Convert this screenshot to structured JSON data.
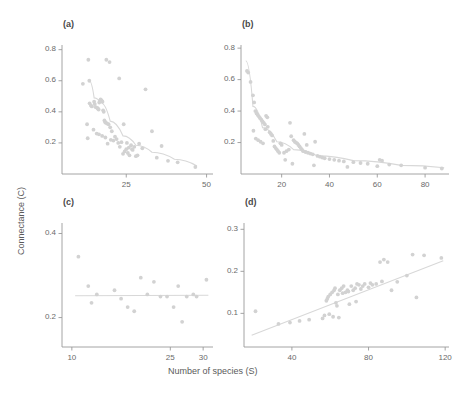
{
  "figure": {
    "xlabel": "Number of species (S)",
    "ylabel": "Connectance (C)",
    "point_color": "#d2d2d2",
    "trend_color": "#d8d8d8",
    "axis_color": "#9a9a9a"
  },
  "panels": {
    "a": {
      "label": "(a)"
    },
    "b": {
      "label": "(b)"
    },
    "c": {
      "label": "(c)"
    },
    "d": {
      "label": "(d)"
    }
  },
  "chart_data": [
    {
      "type": "scatter",
      "panel": "(a)",
      "title": "",
      "xlabel": "Number of species (S)",
      "ylabel": "Connectance (C)",
      "xlim": [
        5,
        52
      ],
      "ylim": [
        0.0,
        0.83
      ],
      "xticks": [
        25,
        50
      ],
      "yticks": [
        0.2,
        0.4,
        0.6,
        0.8
      ],
      "xticklabels": [
        "25",
        "50"
      ],
      "yticklabels": [
        "0.2",
        "0.4",
        "0.6",
        "0.8"
      ],
      "grid": false,
      "legend": null,
      "x": [
        11.5,
        13.5,
        13.6,
        14.0,
        14.3,
        15.0,
        15.2,
        15.5,
        16.0,
        16.2,
        16.4,
        16.6,
        16.8,
        17.0,
        17.2,
        17.4,
        17.6,
        17.8,
        18.0,
        18.2,
        18.4,
        18.6,
        19.0,
        19.5,
        20.0,
        20.5,
        12.8,
        13.0,
        14.8,
        15.8,
        16.5,
        17.5,
        18.5,
        19.2,
        20.2,
        21.0,
        21.5,
        22.0,
        22.5,
        23.0,
        23.5,
        24.0,
        24.5,
        25.0,
        25.2,
        25.5,
        26.0,
        26.5,
        27.0,
        27.5,
        28.0,
        28.5,
        29.0,
        30.0,
        31.0,
        33.0,
        34.5,
        36.0,
        38.0,
        41.0,
        46.5,
        13.2,
        18.8,
        19.8,
        22.8,
        24.2,
        25.8,
        26.8
      ],
      "y": [
        0.58,
        0.6,
        0.455,
        0.44,
        0.435,
        0.465,
        0.45,
        0.43,
        0.425,
        0.42,
        0.415,
        0.46,
        0.47,
        0.48,
        0.475,
        0.47,
        0.465,
        0.41,
        0.4,
        0.345,
        0.335,
        0.33,
        0.325,
        0.32,
        0.3,
        0.275,
        0.32,
        0.23,
        0.285,
        0.26,
        0.255,
        0.245,
        0.235,
        0.195,
        0.22,
        0.215,
        0.24,
        0.225,
        0.2,
        0.175,
        0.205,
        0.13,
        0.145,
        0.16,
        0.2,
        0.135,
        0.12,
        0.185,
        0.155,
        0.175,
        0.115,
        0.12,
        0.195,
        0.165,
        0.545,
        0.275,
        0.105,
        0.18,
        0.085,
        0.075,
        0.045,
        0.735,
        0.735,
        0.72,
        0.615,
        0.32,
        0.17,
        0.16
      ],
      "trend": {
        "type": "power-fit",
        "x": [
          13.5,
          15,
          17,
          20,
          24,
          28,
          33,
          40,
          47
        ],
        "y": [
          0.6,
          0.49,
          0.46,
          0.34,
          0.245,
          0.185,
          0.14,
          0.095,
          0.052
        ]
      }
    },
    {
      "type": "scatter",
      "panel": "(b)",
      "title": "",
      "xlabel": "Number of species (S)",
      "ylabel": "Connectance (C)",
      "xlim": [
        3,
        90
      ],
      "ylim": [
        0.0,
        0.82
      ],
      "xticks": [
        20,
        40,
        60,
        80
      ],
      "yticks": [
        0.2,
        0.4,
        0.6,
        0.8
      ],
      "xticklabels": [
        "20",
        "40",
        "60",
        "80"
      ],
      "yticklabels": [
        "0.2",
        "0.4",
        "0.6",
        "0.8"
      ],
      "grid": false,
      "legend": null,
      "x": [
        5.5,
        6.0,
        7.0,
        8.0,
        8.5,
        9.0,
        9.5,
        10.0,
        10.5,
        11.0,
        11.5,
        12.0,
        12.5,
        13.0,
        13.5,
        14.0,
        8.2,
        9.2,
        10.2,
        11.2,
        12.2,
        13.2,
        14.2,
        15.0,
        15.5,
        16.0,
        16.5,
        17.0,
        17.5,
        18.0,
        18.5,
        19.0,
        19.5,
        20.0,
        21.0,
        22.0,
        23.0,
        24.0,
        25.0,
        25.5,
        26.0,
        26.5,
        27.0,
        27.5,
        28.0,
        28.5,
        29.0,
        30.0,
        31.0,
        32.0,
        33.0,
        34.0,
        35.0,
        36.0,
        37.0,
        38.0,
        40.0,
        42.0,
        44.0,
        46.0,
        47.5,
        50.0,
        53.0,
        56.0,
        60.0,
        61.0,
        62.0,
        65.0,
        70.0,
        80.0,
        87.0,
        23.5,
        29.5,
        30.5,
        24.5,
        33.5,
        21.5
      ],
      "y": [
        0.655,
        0.645,
        0.585,
        0.5,
        0.455,
        0.4,
        0.385,
        0.375,
        0.365,
        0.355,
        0.345,
        0.335,
        0.325,
        0.315,
        0.37,
        0.36,
        0.275,
        0.225,
        0.215,
        0.205,
        0.195,
        0.285,
        0.3,
        0.265,
        0.255,
        0.245,
        0.21,
        0.175,
        0.165,
        0.155,
        0.145,
        0.135,
        0.195,
        0.185,
        0.135,
        0.145,
        0.155,
        0.24,
        0.215,
        0.205,
        0.2,
        0.195,
        0.185,
        0.175,
        0.165,
        0.155,
        0.145,
        0.14,
        0.135,
        0.13,
        0.125,
        0.205,
        0.115,
        0.11,
        0.105,
        0.1,
        0.095,
        0.09,
        0.085,
        0.08,
        0.045,
        0.075,
        0.07,
        0.065,
        0.05,
        0.09,
        0.085,
        0.06,
        0.055,
        0.04,
        0.035,
        0.325,
        0.255,
        0.185,
        0.065,
        0.055,
        0.09
      ],
      "trend": {
        "type": "power-fit",
        "x": [
          5,
          8,
          12,
          18,
          25,
          35,
          50,
          70,
          88
        ],
        "y": [
          0.72,
          0.43,
          0.295,
          0.205,
          0.155,
          0.115,
          0.085,
          0.055,
          0.04
        ]
      }
    },
    {
      "type": "scatter",
      "panel": "(c)",
      "title": "",
      "xlabel": "Number of species (S)",
      "ylabel": "Connectance (C)",
      "xlim": [
        8.5,
        31.5
      ],
      "ylim": [
        0.13,
        0.425
      ],
      "xticks": [
        10,
        25,
        30
      ],
      "yticks": [
        0.2,
        0.4
      ],
      "xticklabels": [
        "10",
        "25",
        "30"
      ],
      "yticklabels": [
        "0.2",
        "0.4"
      ],
      "grid": false,
      "legend": null,
      "x": [
        11.0,
        12.5,
        13.0,
        13.8,
        16.5,
        17.5,
        18.5,
        19.5,
        20.5,
        21.5,
        22.5,
        23.5,
        24.5,
        25.5,
        26.2,
        26.8,
        27.5,
        28.5,
        29.0,
        30.5
      ],
      "y": [
        0.345,
        0.275,
        0.235,
        0.255,
        0.265,
        0.245,
        0.225,
        0.215,
        0.295,
        0.255,
        0.285,
        0.25,
        0.25,
        0.225,
        0.275,
        0.19,
        0.25,
        0.255,
        0.25,
        0.29
      ],
      "trend": {
        "type": "linear-fit",
        "x": [
          10.5,
          30.8
        ],
        "y": [
          0.252,
          0.253
        ]
      }
    },
    {
      "type": "scatter",
      "panel": "(d)",
      "title": "",
      "xlabel": "Number of species (S)",
      "ylabel": "Connectance (C)",
      "xlim": [
        15,
        122
      ],
      "ylim": [
        0.02,
        0.315
      ],
      "xticks": [
        40,
        80,
        120
      ],
      "yticks": [
        0.1,
        0.2,
        0.3
      ],
      "xticklabels": [
        "40",
        "80",
        "120"
      ],
      "yticklabels": [
        "0.1",
        "0.2",
        "0.3"
      ],
      "grid": false,
      "legend": null,
      "x": [
        21.0,
        33.0,
        39.0,
        44.0,
        49.0,
        56.0,
        57.0,
        58.0,
        58.5,
        59.0,
        60.0,
        61.0,
        62.0,
        62.5,
        63.0,
        63.5,
        64.0,
        65.0,
        66.0,
        67.0,
        68.0,
        69.0,
        70.0,
        71.0,
        72.0,
        73.0,
        74.0,
        75.0,
        76.0,
        77.0,
        78.0,
        80.0,
        81.0,
        82.0,
        84.0,
        86.0,
        88.0,
        90.0,
        92.0,
        95.0,
        100.0,
        103.0,
        105.0,
        109.0,
        118.0,
        59.5,
        61.5,
        64.5,
        66.5,
        69.5,
        73.5,
        87.0
      ],
      "y": [
        0.105,
        0.075,
        0.078,
        0.082,
        0.085,
        0.088,
        0.095,
        0.13,
        0.135,
        0.14,
        0.145,
        0.15,
        0.155,
        0.16,
        0.125,
        0.118,
        0.145,
        0.155,
        0.16,
        0.165,
        0.15,
        0.155,
        0.122,
        0.165,
        0.155,
        0.16,
        0.17,
        0.168,
        0.158,
        0.165,
        0.17,
        0.162,
        0.172,
        0.168,
        0.17,
        0.222,
        0.228,
        0.222,
        0.155,
        0.175,
        0.19,
        0.24,
        0.138,
        0.238,
        0.232,
        0.098,
        0.092,
        0.09,
        0.148,
        0.152,
        0.128,
        0.176
      ],
      "trend": {
        "type": "linear-fit",
        "x": [
          19,
          119
        ],
        "y": [
          0.048,
          0.225
        ]
      }
    }
  ]
}
